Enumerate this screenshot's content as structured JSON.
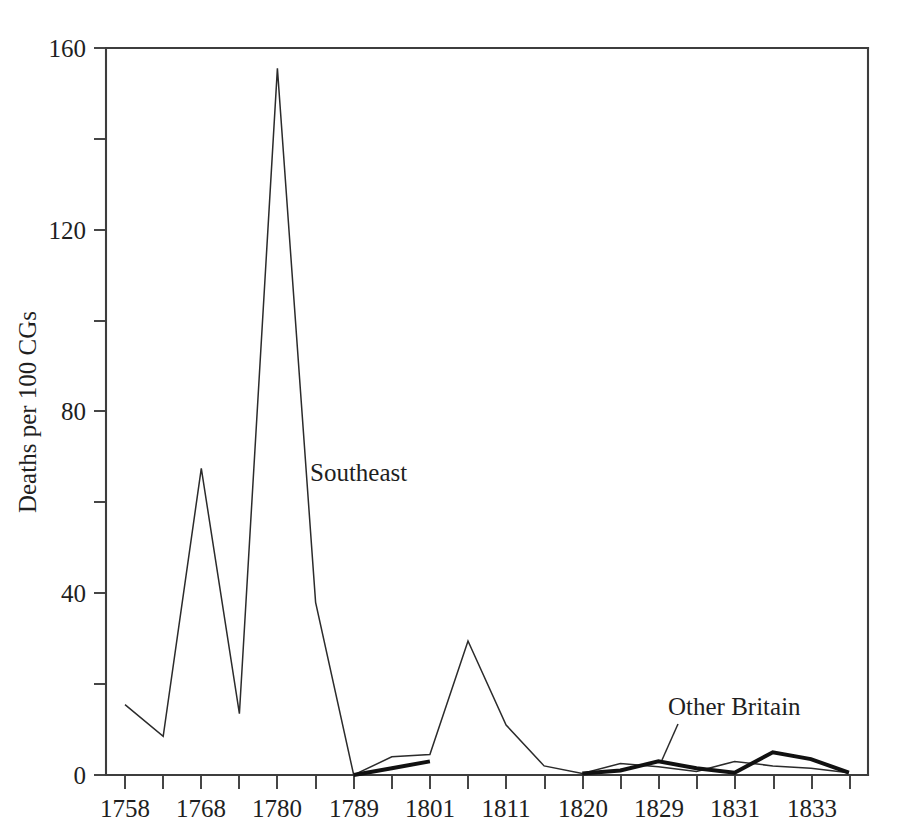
{
  "chart_data": {
    "type": "line",
    "title": "",
    "xlabel": "",
    "ylabel": "Deaths per 100 CGs",
    "ylim": [
      0,
      160
    ],
    "yticks": [
      0,
      40,
      80,
      120,
      160
    ],
    "ytick_labels": [
      "0",
      "40",
      "80",
      "120",
      "160"
    ],
    "yminor_ticks": [
      20,
      60,
      100,
      140
    ],
    "grid": false,
    "legend_position": "inline-annotation",
    "x": [
      "1758",
      "1763",
      "1768",
      "1774",
      "1780",
      "1785",
      "1789",
      "1795",
      "1801",
      "1806",
      "1811",
      "1816",
      "1820",
      "1825",
      "1829",
      "1830",
      "1831",
      "1832",
      "1833",
      "1834"
    ],
    "xtick_labels": [
      "1758",
      "",
      "1768",
      "",
      "1780",
      "",
      "1789",
      "",
      "1801",
      "",
      "1811",
      "",
      "1820",
      "",
      "1829",
      "",
      "1831",
      "",
      "1833",
      ""
    ],
    "xtick_labels_shown": [
      "1758",
      "1768",
      "1780",
      "1789",
      "1801",
      "1811",
      "1820",
      "1829",
      "1831",
      "1833"
    ],
    "series": [
      {
        "name": "Southeast",
        "style": "thin",
        "color": "#2b2b2b",
        "values": [
          15.5,
          8.5,
          67.5,
          13.5,
          155.5,
          38.0,
          0.0,
          4.0,
          4.5,
          29.5,
          11.0,
          2.0,
          0.3,
          2.5,
          1.8,
          0.8,
          3.0,
          2.0,
          1.5,
          0.5
        ]
      },
      {
        "name": "Other Britain",
        "style": "thick",
        "color": "#111111",
        "values": [
          null,
          null,
          null,
          null,
          null,
          null,
          0.0,
          1.5,
          3.0,
          null,
          null,
          null,
          0.3,
          1.0,
          3.0,
          1.5,
          0.5,
          5.0,
          3.5,
          0.5
        ]
      }
    ],
    "annotations": [
      {
        "text": "Southeast",
        "x_px": 310,
        "y_px": 475,
        "leader": false
      },
      {
        "text": "Other Britain",
        "x_px": 668,
        "y_px": 715,
        "leader": true
      }
    ]
  },
  "axis": {
    "ylabel": "Deaths per 100 CGs",
    "ytick_0": "0",
    "ytick_40": "40",
    "ytick_80": "80",
    "ytick_120": "120",
    "ytick_160": "160",
    "xtick_1758": "1758",
    "xtick_1768": "1768",
    "xtick_1780": "1780",
    "xtick_1789": "1789",
    "xtick_1801": "1801",
    "xtick_1811": "1811",
    "xtick_1820": "1820",
    "xtick_1829": "1829",
    "xtick_1831": "1831",
    "xtick_1833": "1833"
  },
  "annotations": {
    "southeast": "Southeast",
    "other_britain": "Other Britain"
  }
}
